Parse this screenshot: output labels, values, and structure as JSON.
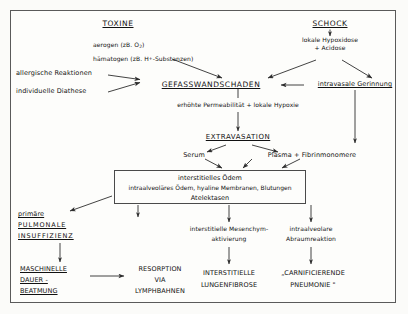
{
  "diagram": {
    "title_left": "TOXINE",
    "title_right": "SCHOCK",
    "toxine_detail_line1": "aerogen (zB. O",
    "toxine_detail_line1_sub": "2",
    "toxine_detail_line1_end": ")",
    "toxine_detail_line2": "hämatogen (zB. H",
    "toxine_detail_line2_sup": "+",
    "toxine_detail_line2_end": "-Substanzen)",
    "shock_detail_line1": "lokale Hypoxidose",
    "shock_detail_line2": "+ Acidose",
    "left_factor_1": "allergische Reaktionen",
    "left_factor_2": "individuelle Diathese",
    "vessel_damage": "GEFASSWANDSCHADEN",
    "intravascular_coagulation": "intravasale Gerinnung",
    "permeability": "erhöhte Permeabilität + lokale Hypoxie",
    "extravasation": "EXTRAVASATION",
    "serum": "Serum",
    "plasma": "Plasma + Fibrinmonomere",
    "edema_box_line1": "interstitielles Ödem",
    "edema_box_line2": "intraalveoläres Ödem, hyaline Membranen, Blutungen",
    "edema_box_line3": "Atelektasen",
    "outcome_left_line1": "primäre",
    "outcome_left_line2": "PULMONALE",
    "outcome_left_line3": "INSUFFIZIENZ",
    "outcome_mid_line1": "interstitielle Mesenchym-",
    "outcome_mid_line2": "aktivierung",
    "outcome_right_line1": "intraalveolare",
    "outcome_right_line2": "Abraumreaktion",
    "bottom_left_line1": "MASCHINELLE",
    "bottom_left_line2": "DAUER -",
    "bottom_left_line3": "BEATMUNG",
    "bottom_resorption_line1": "RESORPTION",
    "bottom_resorption_line2": "VIA",
    "bottom_resorption_line3": "LYMPHBAHNEN",
    "bottom_mid_line1": "INTERSTITIELLE",
    "bottom_mid_line2": "LUNGENFIBROSE",
    "bottom_right_line1": "„CARNIFICIERENDE",
    "bottom_right_line2": "PNEUMONIE \""
  },
  "colors": {
    "ink": "#111111",
    "line": "#3c3c3c",
    "frame": "#5a5a5a",
    "paper": "#fdfdfb"
  }
}
